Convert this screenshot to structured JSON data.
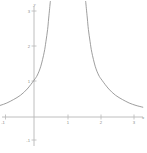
{
  "chart_data": {
    "type": "line",
    "title": "",
    "subtitle": "",
    "xlabel": "x",
    "ylabel": "y",
    "xlim": [
      -1.2,
      3.25
    ],
    "ylim": [
      -1.35,
      3.3
    ],
    "grid": false,
    "legend": false,
    "xticks": [
      -1,
      1,
      2,
      3
    ],
    "xtick_labels": [
      "-1",
      "1",
      "2",
      "3"
    ],
    "yticks": [
      1,
      2,
      3,
      -1
    ],
    "ytick_labels": [
      "1",
      "2",
      "3",
      "-1"
    ],
    "axis_color": "#b3b3b3",
    "curve_color": "#8c8c8c",
    "background": "#ffffff",
    "asymptotes": [
      0.5,
      1.5
    ],
    "series": [
      {
        "name": "left-branch",
        "comment": "rises from near zero at x=-1.2 to +infinity at x=0.5",
        "x": [
          -1.2,
          -1.0,
          -0.8,
          -0.6,
          -0.4,
          -0.2,
          0.0,
          0.1,
          0.2,
          0.3,
          0.35,
          0.4,
          0.43,
          0.45,
          0.47,
          0.48
        ],
        "y": [
          0.28,
          0.33,
          0.4,
          0.5,
          0.62,
          0.8,
          1.05,
          1.2,
          1.45,
          1.85,
          2.15,
          2.5,
          2.8,
          3.0,
          3.2,
          3.3
        ]
      },
      {
        "name": "right-branch",
        "comment": "falls from +infinity at x=1.5 toward zero at x=3.2",
        "x": [
          1.52,
          1.53,
          1.55,
          1.57,
          1.6,
          1.65,
          1.7,
          1.8,
          1.9,
          2.0,
          2.2,
          2.4,
          2.6,
          2.8,
          3.0,
          3.2
        ],
        "y": [
          3.3,
          3.2,
          3.0,
          2.8,
          2.5,
          2.15,
          1.85,
          1.45,
          1.2,
          1.05,
          0.8,
          0.62,
          0.5,
          0.4,
          0.33,
          0.28
        ]
      }
    ]
  },
  "labels": {
    "x_axis_name": "x",
    "y_axis_name": "y",
    "x_neg1": "-1",
    "x_1": "1",
    "x_2": "2",
    "x_3": "3",
    "y_1": "1",
    "y_2": "2",
    "y_3": "3",
    "y_neg1": "-1"
  }
}
